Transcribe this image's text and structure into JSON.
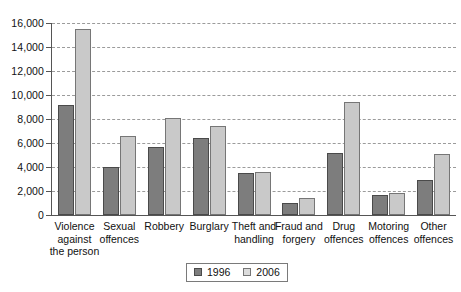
{
  "chart_data": {
    "type": "bar",
    "title": "",
    "subtitle": "",
    "xlabel": "",
    "ylabel": "",
    "ylim": [
      0,
      16000
    ],
    "ytick_step": 2000,
    "yticks": [
      "0",
      "2,000",
      "4,000",
      "6,000",
      "8,000",
      "10,000",
      "12,000",
      "14,000",
      "16,000"
    ],
    "grid": true,
    "grid_style": "dashed-horizontal",
    "legend_position": "bottom-center",
    "categories": [
      "Violence against the person",
      "Sexual offences",
      "Robbery",
      "Burglary",
      "Theft and handling",
      "Fraud and forgery",
      "Drug offences",
      "Motoring offences",
      "Other offences"
    ],
    "category_lines": [
      [
        "Violence",
        "against",
        "the person"
      ],
      [
        "Sexual",
        "offences"
      ],
      [
        "Robbery"
      ],
      [
        "Burglary"
      ],
      [
        "Theft and",
        "handling"
      ],
      [
        "Fraud and",
        "forgery"
      ],
      [
        "Drug",
        "offences"
      ],
      [
        "Motoring",
        "offences"
      ],
      [
        "Other",
        "offences"
      ]
    ],
    "series": [
      {
        "name": "1996",
        "color": "#7d7d7d",
        "values": [
          9200,
          4000,
          5700,
          6400,
          3500,
          1000,
          5200,
          1700,
          2900
        ]
      },
      {
        "name": "2006",
        "color": "#c9c9c9",
        "values": [
          15500,
          6600,
          8100,
          7400,
          3600,
          1400,
          9400,
          1800,
          5100
        ]
      }
    ]
  },
  "legend": {
    "items": [
      {
        "label": "1996",
        "color": "#7d7d7d"
      },
      {
        "label": "2006",
        "color": "#dcdcdc"
      }
    ]
  },
  "colors": {
    "series_1996": "#7d7d7d",
    "series_2006": "#c9c9c9",
    "axis": "#555555",
    "grid": "#9b9b9b",
    "background": "#ffffff",
    "text": "#111111"
  }
}
